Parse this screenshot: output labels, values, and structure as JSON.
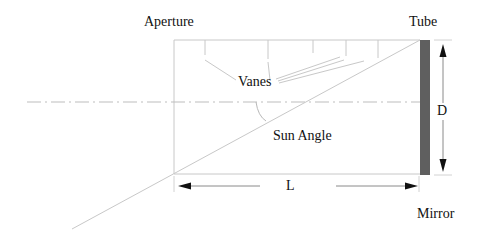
{
  "diagram": {
    "labels": {
      "aperture": "Aperture",
      "tube": "Tube",
      "vanes": "Vanes",
      "sun_angle": "Sun Angle",
      "diameter": "D",
      "length": "L",
      "mirror": "Mirror"
    },
    "colors": {
      "line": "#c8c8c8",
      "axis": "#bdbdbd",
      "mirror": "#5f5f5f",
      "arrow": "#8a8a8a",
      "arrowhead": "#111111",
      "text": "#111111"
    },
    "components": {
      "tube": "rectangular baffle tube",
      "vanes_count": 5,
      "mirror": "dark vertical bar at right end of tube",
      "optical_axis": "dash-dot center line",
      "sun_ray": "diagonal line from lower-left through aperture edge to mirror top"
    }
  }
}
